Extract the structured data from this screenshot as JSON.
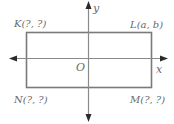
{
  "diagram": {
    "type": "coordinate-plane-rectangle",
    "axes": {
      "x_label": "x",
      "y_label": "y",
      "origin_label": "O"
    },
    "vertices": [
      {
        "name": "K",
        "label": "K(?, ?)",
        "position": "top-left"
      },
      {
        "name": "L",
        "label": "L(a, b)",
        "position": "top-right"
      },
      {
        "name": "M",
        "label": "M(?, ?)",
        "position": "bottom-right"
      },
      {
        "name": "N",
        "label": "N(?, ?)",
        "position": "bottom-left"
      }
    ],
    "colors": {
      "rectangle_stroke": "#7a7a7a",
      "axis_stroke": "#8a8a8a",
      "arrow_fill": "#2a2a2a",
      "label_text": "#6a6a6a"
    }
  }
}
